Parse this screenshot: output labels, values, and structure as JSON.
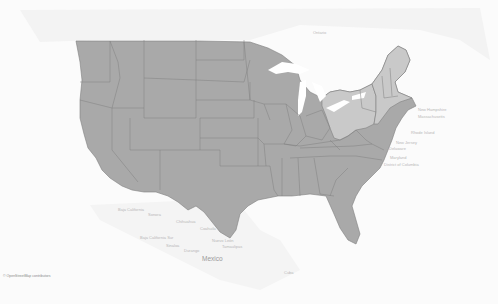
{
  "map": {
    "type": "choropleth",
    "region": "United States",
    "colors": {
      "background": "#fbfbfb",
      "land_outside": "#f2f2f2",
      "water": "#ffffff",
      "state_default": "#a9a9a9",
      "state_highlight": "#c9c9c9",
      "border": "#7f7f7f"
    },
    "highlighted_states": [
      "Ohio",
      "Pennsylvania",
      "West Virginia",
      "New York",
      "Vermont",
      "New Hampshire",
      "Maine",
      "Massachusetts",
      "Connecticut",
      "Rhode Island",
      "New Jersey",
      "Delaware",
      "Maryland"
    ],
    "labels": {
      "ontario": "Ontario",
      "new_hampshire": "New Hampshire",
      "massachusetts": "Massachusetts",
      "rhode_island": "Rhode Island",
      "new_jersey": "New Jersey",
      "delaware": "Delaware",
      "maryland": "Maryland",
      "dc": "District of Columbia",
      "baja_california": "Baja California",
      "sonora": "Sonora",
      "chihuahua": "Chihuahua",
      "coahuila": "Coahuila",
      "baja_california_sur": "Baja California Sur",
      "sinaloa": "Sinaloa",
      "durango": "Durango",
      "nuevo_leon": "Nuevo León",
      "tamaulipas": "Tamaulipas",
      "mexico": "Mexico",
      "cuba": "Cuba"
    },
    "attribution": "© OpenStreetMap contributors"
  }
}
